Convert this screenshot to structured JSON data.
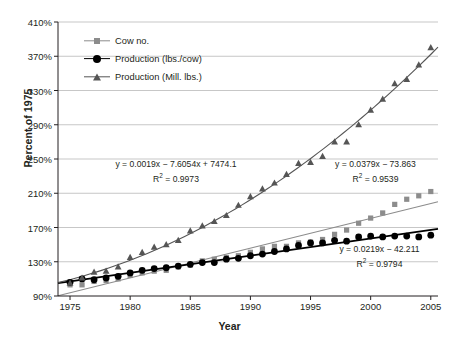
{
  "chart_data": {
    "type": "scatter",
    "title": "",
    "xlabel": "Year",
    "ylabel": "Percent of 1975",
    "xlim": [
      1974,
      2005.6
    ],
    "ylim": [
      90,
      410
    ],
    "xticks": [
      1975,
      1980,
      1985,
      1990,
      1995,
      2000,
      2005
    ],
    "xticklabels": [
      "1975",
      "1980",
      "1985",
      "1990",
      "1995",
      "2000",
      "2005"
    ],
    "yticks": [
      90,
      130,
      170,
      210,
      250,
      290,
      330,
      370,
      410
    ],
    "yticklabels": [
      "90%",
      "130%",
      "170%",
      "210%",
      "250%",
      "290%",
      "330%",
      "370%",
      "410%"
    ],
    "grid": "horizontal",
    "legend_position": "upper-left-inside",
    "x": [
      1975,
      1976,
      1977,
      1978,
      1979,
      1980,
      1981,
      1982,
      1983,
      1984,
      1985,
      1986,
      1987,
      1988,
      1989,
      1990,
      1991,
      1992,
      1993,
      1994,
      1995,
      1996,
      1997,
      1998,
      1999,
      2000,
      2001,
      2002,
      2003,
      2004,
      2005
    ],
    "series": [
      {
        "name": "Cow no.",
        "marker": "square",
        "color": "#8c8c8c",
        "trend": "linear",
        "trend_color": "#8c8c8c",
        "values": [
          103,
          103,
          107,
          108,
          110,
          114,
          117,
          119,
          120,
          124,
          126,
          131,
          133,
          135,
          137,
          141,
          145,
          148,
          148,
          152,
          153,
          156,
          162,
          167,
          175,
          181,
          187,
          197,
          203,
          207,
          212
        ]
      },
      {
        "name": "Production (lbs./cow)",
        "marker": "circle",
        "color": "#000000",
        "trend": "linear",
        "trend_color": "#000000",
        "values": [
          106,
          110,
          109,
          111,
          113,
          117,
          120,
          122,
          123,
          125,
          127,
          129,
          129,
          133,
          134,
          137,
          139,
          142,
          145,
          149,
          152,
          152,
          155,
          154,
          159,
          160,
          159,
          160,
          160,
          159,
          161
        ]
      },
      {
        "name": "Production (Mill. lbs.)",
        "marker": "triangle",
        "color": "#555555",
        "trend": "polynomial",
        "trend_color": "#555555",
        "values": [
          105,
          111,
          118,
          119,
          124,
          135,
          141,
          147,
          150,
          155,
          166,
          172,
          177,
          184,
          196,
          206,
          215,
          222,
          232,
          245,
          246,
          253,
          270,
          270,
          290,
          307,
          320,
          338,
          343,
          360,
          380
        ]
      }
    ],
    "annotations": [
      {
        "id": "poly-fit-production-mill-lbs",
        "equation": "y = 0.0019x − 7.6054x + 7474.1",
        "r_squared_label": "R",
        "r_squared_sup": "2",
        "r_squared_value": "= 0.9973",
        "r_squared_full": "R² = 0.9973"
      },
      {
        "id": "linear-fit-cow-no",
        "equation": "y = 0.0379x − 73.863",
        "r_squared_label": "R",
        "r_squared_sup": "2",
        "r_squared_value": "= 0.9539",
        "r_squared_full": "R² = 0.9539"
      },
      {
        "id": "linear-fit-production-lbs-cow",
        "equation": "y = 0.0219x − 42.211",
        "r_squared_label": "R",
        "r_squared_sup": "2",
        "r_squared_value": "= 0.9794",
        "r_squared_full": "R² = 0.9794"
      }
    ]
  },
  "colors": {
    "axis": "#231f20",
    "grid": "#b9b9b9",
    "cow_no": "#8c8c8c",
    "production_lbs_cow": "#000000",
    "production_mill_lbs": "#555555",
    "background": "#ffffff"
  }
}
